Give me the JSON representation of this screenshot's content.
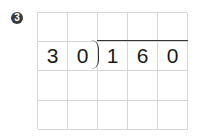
{
  "problem": {
    "number_badge": "3",
    "divisor": [
      "3",
      "0"
    ],
    "dividend": [
      "1",
      "6",
      "0"
    ],
    "grid": {
      "rows": [
        [
          "",
          "",
          "",
          "",
          ""
        ],
        [
          "3",
          "0",
          "1",
          "6",
          "0"
        ],
        [
          "",
          "",
          "",
          "",
          ""
        ],
        [
          "",
          "",
          "",
          "",
          ""
        ]
      ]
    }
  }
}
